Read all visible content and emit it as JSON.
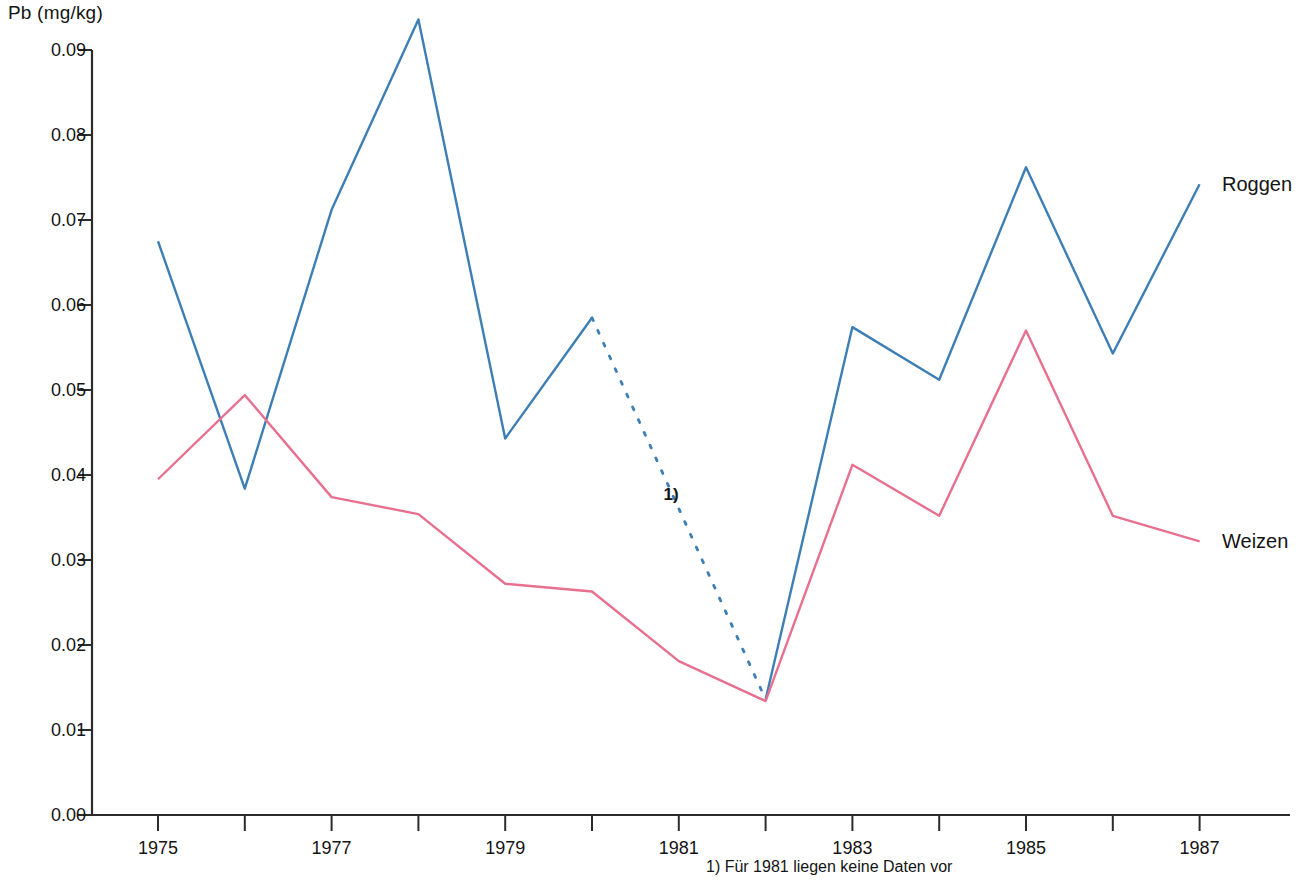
{
  "chart_data": {
    "type": "line",
    "title": "",
    "xlabel": "",
    "ylabel": "Pb (mg/kg)",
    "x": [
      1975,
      1976,
      1977,
      1978,
      1979,
      1980,
      1981,
      1982,
      1983,
      1984,
      1985,
      1986,
      1987
    ],
    "xticks": [
      1975,
      1976,
      1977,
      1978,
      1979,
      1980,
      1981,
      1982,
      1983,
      1984,
      1985,
      1986,
      1987
    ],
    "xtick_labels": [
      "1975",
      "",
      "1977",
      "",
      "1979",
      "",
      "1981",
      "",
      "1983",
      "",
      "1985",
      "",
      "1987"
    ],
    "xlim": [
      1974.5,
      1987.6
    ],
    "ylim": [
      0.0,
      0.094
    ],
    "ytick_labels": [
      "0.00",
      "0.01",
      "0.02",
      "0.03",
      "0.04",
      "0.05",
      "0.06",
      "0.07",
      "0.08",
      "0.09"
    ],
    "yticks": [
      0.0,
      0.01,
      0.02,
      0.03,
      0.04,
      0.05,
      0.06,
      0.07,
      0.08,
      0.09
    ],
    "grid": false,
    "legend_position": "right-of-line-ends",
    "series": [
      {
        "name": "Roggen",
        "color": "#3d7fb5",
        "values": [
          0.0675,
          0.0384,
          0.0712,
          0.0936,
          0.0443,
          0.0585,
          null,
          0.0136,
          0.0574,
          0.0512,
          0.0762,
          0.0543,
          0.0742
        ],
        "dashed_segment": {
          "from": 1980,
          "to": 1982,
          "note": "1)"
        }
      },
      {
        "name": "Weizen",
        "color": "#e8708f",
        "values": [
          0.0395,
          0.0494,
          0.0374,
          0.0354,
          0.0272,
          0.0263,
          0.0181,
          0.0134,
          0.0412,
          0.0352,
          0.057,
          0.0352,
          0.0322
        ]
      }
    ],
    "annotations": [
      {
        "name": "footnote-marker",
        "text": "1)",
        "x": 1980.8,
        "y": 0.0376
      },
      {
        "name": "footnote",
        "text": "1) Für 1981 liegen keine Daten vor"
      }
    ]
  },
  "legend": {
    "roggen_label": "Roggen",
    "weizen_label": "Weizen"
  },
  "footnote_text": "1) Für 1981 liegen keine Daten vor",
  "axis": {
    "y_title": "Pb (mg/kg)"
  },
  "colors": {
    "roggen": "#3d7fb5",
    "weizen": "#e8708f",
    "axis": "#2b2b2b",
    "text": "#141414"
  }
}
